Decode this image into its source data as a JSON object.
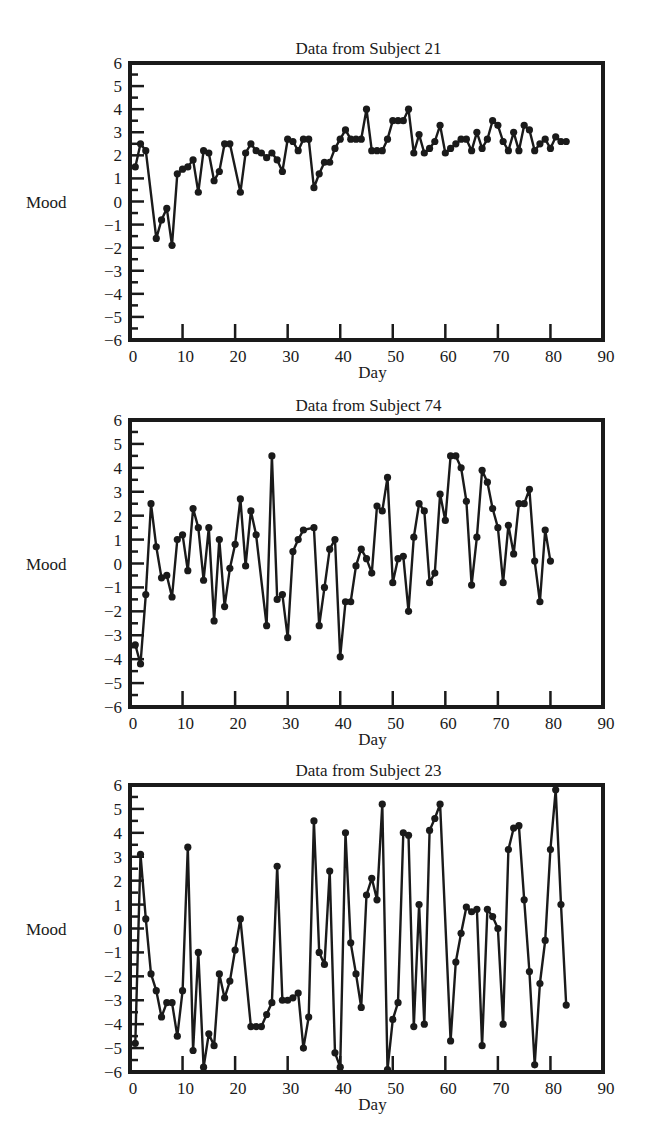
{
  "chart_data": [
    {
      "type": "line",
      "title": "Data from Subject 21",
      "xlabel": "Day",
      "ylabel": "Mood",
      "xlim": [
        0,
        90
      ],
      "ylim": [
        -6,
        6
      ],
      "xticks": [
        0,
        10,
        20,
        30,
        40,
        50,
        60,
        70,
        80,
        90
      ],
      "yticks": [
        6,
        5,
        4,
        3,
        2,
        1,
        0,
        -1,
        -2,
        -3,
        -4,
        -5,
        -6
      ],
      "grid": false,
      "markers": true,
      "x": [
        1,
        2,
        3,
        5,
        6,
        7,
        8,
        9,
        10,
        11,
        12,
        13,
        14,
        15,
        16,
        17,
        18,
        19,
        21,
        22,
        23,
        24,
        25,
        26,
        27,
        28,
        29,
        30,
        31,
        32,
        33,
        34,
        35,
        36,
        37,
        38,
        39,
        40,
        41,
        42,
        43,
        44,
        45,
        46,
        47,
        48,
        49,
        50,
        51,
        52,
        53,
        54,
        55,
        56,
        57,
        58,
        59,
        60,
        61,
        62,
        63,
        64,
        65,
        66,
        67,
        68,
        69,
        70,
        71,
        72,
        73,
        74,
        75,
        76,
        77,
        78,
        79,
        80,
        81,
        82,
        83
      ],
      "y": [
        1.5,
        2.5,
        2.2,
        -1.6,
        -0.8,
        -0.3,
        -1.9,
        1.2,
        1.4,
        1.5,
        1.8,
        0.4,
        2.2,
        2.1,
        0.9,
        1.3,
        2.5,
        2.5,
        0.4,
        2.1,
        2.5,
        2.2,
        2.1,
        1.9,
        2.1,
        1.8,
        1.3,
        2.7,
        2.6,
        2.2,
        2.7,
        2.7,
        0.6,
        1.2,
        1.7,
        1.7,
        2.3,
        2.7,
        3.1,
        2.7,
        2.7,
        2.7,
        4.0,
        2.2,
        2.2,
        2.2,
        2.7,
        3.5,
        3.5,
        3.5,
        4.0,
        2.1,
        2.9,
        2.1,
        2.3,
        2.6,
        3.3,
        2.1,
        2.3,
        2.5,
        2.7,
        2.7,
        2.2,
        3.0,
        2.3,
        2.7,
        3.5,
        3.3,
        2.6,
        2.2,
        3.0,
        2.2,
        3.3,
        3.1,
        2.2,
        2.5,
        2.7,
        2.3,
        2.8,
        2.6,
        2.6
      ]
    },
    {
      "type": "line",
      "title": "Data from Subject 74",
      "xlabel": "Day",
      "ylabel": "Mood",
      "xlim": [
        0,
        90
      ],
      "ylim": [
        -6,
        6
      ],
      "xticks": [
        0,
        10,
        20,
        30,
        40,
        50,
        60,
        70,
        80,
        90
      ],
      "yticks": [
        6,
        5,
        4,
        3,
        2,
        1,
        0,
        -1,
        -2,
        -3,
        -4,
        -5,
        -6
      ],
      "grid": false,
      "markers": true,
      "x": [
        1,
        2,
        3,
        4,
        5,
        6,
        7,
        8,
        9,
        10,
        11,
        12,
        13,
        14,
        15,
        16,
        17,
        18,
        19,
        20,
        21,
        22,
        23,
        24,
        26,
        27,
        28,
        29,
        30,
        31,
        32,
        33,
        35,
        36,
        37,
        38,
        39,
        40,
        41,
        42,
        43,
        44,
        45,
        46,
        47,
        48,
        49,
        50,
        51,
        52,
        53,
        54,
        55,
        56,
        57,
        58,
        59,
        60,
        61,
        62,
        63,
        64,
        65,
        66,
        67,
        68,
        69,
        70,
        71,
        72,
        73,
        74,
        75,
        76,
        77,
        78,
        79,
        80
      ],
      "y": [
        -3.4,
        -4.2,
        -1.3,
        2.5,
        0.7,
        -0.6,
        -0.5,
        -1.4,
        1.0,
        1.2,
        -0.3,
        2.3,
        1.5,
        -0.7,
        1.5,
        -2.4,
        1.0,
        -1.8,
        -0.2,
        0.8,
        2.7,
        -0.1,
        2.2,
        1.2,
        -2.6,
        4.5,
        -1.5,
        -1.3,
        -3.1,
        0.5,
        1.0,
        1.4,
        1.5,
        -2.6,
        -1.0,
        0.6,
        1.0,
        -3.9,
        -1.6,
        -1.6,
        -0.1,
        0.6,
        0.2,
        -0.4,
        2.4,
        2.2,
        3.6,
        -0.8,
        0.2,
        0.3,
        -2.0,
        1.1,
        2.5,
        2.2,
        -0.8,
        -0.4,
        2.9,
        1.8,
        4.5,
        4.5,
        4.0,
        2.6,
        -0.9,
        1.1,
        3.9,
        3.4,
        2.3,
        1.5,
        -0.8,
        1.6,
        0.4,
        2.5,
        2.5,
        3.1,
        0.1,
        -1.6,
        1.4,
        0.1
      ]
    },
    {
      "type": "line",
      "title": "Data from Subject 23",
      "xlabel": "Day",
      "ylabel": "Mood",
      "xlim": [
        0,
        90
      ],
      "ylim": [
        -6,
        6
      ],
      "xticks": [
        0,
        10,
        20,
        30,
        40,
        50,
        60,
        70,
        80,
        90
      ],
      "yticks": [
        6,
        5,
        4,
        3,
        2,
        1,
        0,
        -1,
        -2,
        -3,
        -4,
        -5,
        -6
      ],
      "grid": false,
      "markers": true,
      "x": [
        1,
        2,
        3,
        4,
        5,
        6,
        7,
        8,
        9,
        10,
        11,
        12,
        13,
        14,
        15,
        16,
        17,
        18,
        19,
        20,
        21,
        23,
        24,
        25,
        26,
        27,
        28,
        29,
        30,
        31,
        32,
        33,
        34,
        35,
        36,
        37,
        38,
        39,
        40,
        41,
        42,
        43,
        44,
        45,
        46,
        47,
        48,
        49,
        50,
        51,
        52,
        53,
        54,
        55,
        56,
        57,
        58,
        59,
        61,
        62,
        63,
        64,
        65,
        66,
        67,
        68,
        69,
        70,
        71,
        72,
        73,
        74,
        75,
        76,
        77,
        78,
        79,
        80,
        81,
        82,
        83
      ],
      "y": [
        -4.8,
        3.1,
        0.4,
        -1.9,
        -2.6,
        -3.7,
        -3.1,
        -3.1,
        -4.5,
        -2.6,
        3.4,
        -5.1,
        -1.0,
        -5.8,
        -4.4,
        -4.9,
        -1.9,
        -2.9,
        -2.2,
        -0.9,
        0.4,
        -4.1,
        -4.1,
        -4.1,
        -3.6,
        -3.1,
        2.6,
        -3.0,
        -3.0,
        -2.9,
        -2.7,
        -5.0,
        -3.7,
        4.5,
        -1.0,
        -1.5,
        2.4,
        -5.2,
        -5.8,
        4.0,
        -0.6,
        -1.9,
        -3.3,
        1.4,
        2.1,
        1.2,
        5.2,
        -5.9,
        -3.8,
        -3.1,
        4.0,
        3.9,
        -4.1,
        1.0,
        -4.0,
        4.1,
        4.6,
        5.2,
        -4.7,
        -1.4,
        -0.2,
        0.9,
        0.7,
        0.8,
        -4.9,
        0.8,
        0.5,
        0.0,
        -4.0,
        3.3,
        4.2,
        4.3,
        1.2,
        -1.8,
        -5.7,
        -2.3,
        -0.5,
        3.3,
        5.8,
        1.0,
        -3.2
      ]
    }
  ],
  "panels": [
    {
      "title": "Data from Subject 21",
      "xlabel": "Day",
      "ylabel": "Mood"
    },
    {
      "title": "Data from Subject 74",
      "xlabel": "Day",
      "ylabel": "Mood"
    },
    {
      "title": "Data from Subject 23",
      "xlabel": "Day",
      "ylabel": "Mood"
    }
  ]
}
